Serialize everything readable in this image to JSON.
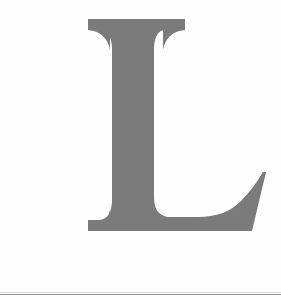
{
  "page": {
    "kind": "scanned-page-fragment",
    "background_color": "#ffffff",
    "width": 281,
    "height": 297
  },
  "dropcap": {
    "character": "L",
    "role": "decorative-initial",
    "style": "serif-bracketed",
    "ink_color": "#7b7b7b",
    "texture": "dithered-halftone",
    "bounds": {
      "left": 88,
      "top": 19,
      "right": 266,
      "bottom": 231
    },
    "stem": {
      "left": 112,
      "right": 152
    },
    "top_serif": {
      "left": 88,
      "right": 185,
      "top": 19,
      "thickness": 11
    },
    "foot_serif": {
      "left": 88,
      "right": 266,
      "baseline": 231
    },
    "tail_terminal": {
      "x": 265,
      "y": 172
    }
  },
  "rules": [
    {
      "name": "page-bottom-rule",
      "y": 294,
      "color": "#8e9094",
      "thickness": 1
    },
    {
      "name": "page-bottom-rule-shadow",
      "y": 292,
      "color": "#d9dadc",
      "thickness": 1
    }
  ]
}
